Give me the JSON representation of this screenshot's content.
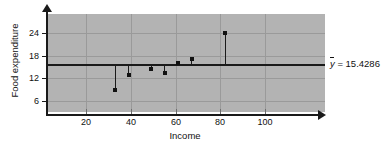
{
  "chart_data": {
    "type": "scatter",
    "title": "",
    "xlabel": "Income",
    "ylabel": "Food expenditure",
    "xlim": [
      0,
      124
    ],
    "ylim": [
      0,
      26
    ],
    "xticks": [
      20,
      40,
      60,
      80,
      100
    ],
    "yticks": [
      6,
      12,
      18,
      24
    ],
    "grid": true,
    "legend": "none",
    "x": [
      33,
      39,
      49,
      55,
      61,
      67,
      82
    ],
    "y": [
      9,
      13,
      14.5,
      13.5,
      16,
      17,
      24
    ],
    "points": [
      {
        "x": 33,
        "y": 9
      },
      {
        "x": 39,
        "y": 13
      },
      {
        "x": 49,
        "y": 14.5
      },
      {
        "x": 55,
        "y": 13.5
      },
      {
        "x": 61,
        "y": 16
      },
      {
        "x": 67,
        "y": 17
      },
      {
        "x": 82,
        "y": 24
      }
    ],
    "annotations": [
      {
        "name": "mean-line",
        "type": "hline",
        "value": 15.4286,
        "label": "y = 15.4286"
      }
    ],
    "mean_line_value": 15.4286,
    "mean_label_symbol": "y",
    "mean_label_rest": "= 15.4286",
    "colors": {
      "panel_background": "#b3b3b3",
      "gridline": "#9a9a9a",
      "axis": "#1a1a1a",
      "marker": "#111111",
      "mean_line": "#1a1a1a"
    }
  },
  "axes": {
    "y_title": "Food expenditure",
    "x_title": "Income",
    "y_tick_labels": [
      "24",
      "18",
      "12",
      "6"
    ],
    "x_tick_labels": [
      "20",
      "40",
      "60",
      "80",
      "100"
    ]
  }
}
